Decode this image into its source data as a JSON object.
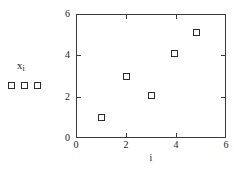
{
  "chart_data": {
    "type": "scatter",
    "title": "",
    "xlabel": "i",
    "ylabel": "",
    "legend_label": "x",
    "legend_label_sub": "i",
    "legend_marker_count": 3,
    "marker": "open-square",
    "grid": false,
    "legend_position": "left-outside",
    "xlim": [
      0,
      6
    ],
    "ylim": [
      0,
      6
    ],
    "xticks": [
      0,
      2,
      4,
      6
    ],
    "yticks": [
      0,
      2,
      4,
      6
    ],
    "xtick_labels": [
      "0",
      "2",
      "4",
      "6"
    ],
    "ytick_labels": [
      "0",
      "2",
      "4",
      "6"
    ],
    "tick_direction": "in",
    "frame": "box",
    "points": [
      {
        "x": 1.0,
        "y": 1.0
      },
      {
        "x": 2.0,
        "y": 3.0
      },
      {
        "x": 3.0,
        "y": 2.05
      },
      {
        "x": 3.95,
        "y": 4.1
      },
      {
        "x": 4.8,
        "y": 5.1
      }
    ],
    "colors": {
      "marker_edge": "#2b2b2b",
      "marker_fill": "#ffffff",
      "axis": "#3a3a3a",
      "text": "#1a1a1a",
      "background": "#ffffff"
    }
  }
}
